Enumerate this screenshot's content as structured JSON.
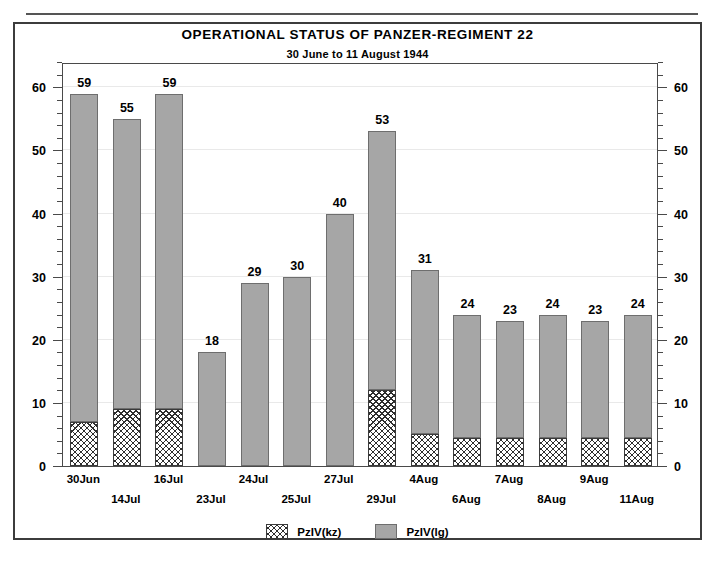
{
  "chart_data": {
    "type": "bar",
    "subtype": "stacked",
    "title": "OPERATIONAL STATUS OF PANZER-REGIMENT 22",
    "subtitle": "30 June to 11 August 1944",
    "xlabel": "",
    "ylabel": "",
    "ylim": [
      0,
      64
    ],
    "ytick_step_major": 10,
    "ytick_step_minor": 2,
    "yticks": [
      0,
      10,
      20,
      30,
      40,
      50,
      60
    ],
    "grid": true,
    "legend_position": "bottom",
    "dual_y_axis": true,
    "categories": [
      "30Jun",
      "14Jul",
      "16Jul",
      "23Jul",
      "24Jul",
      "25Jul",
      "27Jul",
      "29Jul",
      "4Aug",
      "6Aug",
      "7Aug",
      "8Aug",
      "9Aug",
      "11Aug"
    ],
    "totals": [
      59,
      55,
      59,
      18,
      29,
      30,
      40,
      53,
      31,
      24,
      23,
      24,
      23,
      24
    ],
    "series": [
      {
        "name": "PzIV(kz)",
        "fill": "crosshatch",
        "color": "#ffffff",
        "values": [
          7,
          9,
          9,
          0,
          0,
          0,
          0,
          12,
          5,
          4.5,
          4.5,
          4.5,
          4.5,
          4.5
        ]
      },
      {
        "name": "PzIV(lg)",
        "fill": "solid",
        "color": "#a6a6a6",
        "values": [
          52,
          46,
          50,
          18,
          29,
          30,
          40,
          41,
          26,
          19.5,
          18.5,
          19.5,
          18.5,
          19.5
        ]
      }
    ],
    "bar_labels": [
      "59",
      "55",
      "59",
      "18",
      "29",
      "30",
      "40",
      "53",
      "31",
      "24",
      "23",
      "24",
      "23",
      "24"
    ]
  },
  "axis": {
    "left_ticks": [
      "0",
      "10",
      "20",
      "30",
      "40",
      "50",
      "60"
    ],
    "right_ticks": [
      "0",
      "10",
      "20",
      "30",
      "40",
      "50",
      "60"
    ]
  },
  "legend": {
    "items": [
      {
        "label": "PzIV(kz)",
        "swatch": "crosshatch-swatch"
      },
      {
        "label": "PzIV(lg)",
        "swatch": "gray-swatch"
      }
    ]
  },
  "colors": {
    "bar_gray": "#a6a6a6",
    "bar_gray_border": "#6e6e6e",
    "hatch_line": "#2e2e2e",
    "frame": "#3c3c3c",
    "gridline": "#e9e9e9",
    "text": "#000000"
  }
}
